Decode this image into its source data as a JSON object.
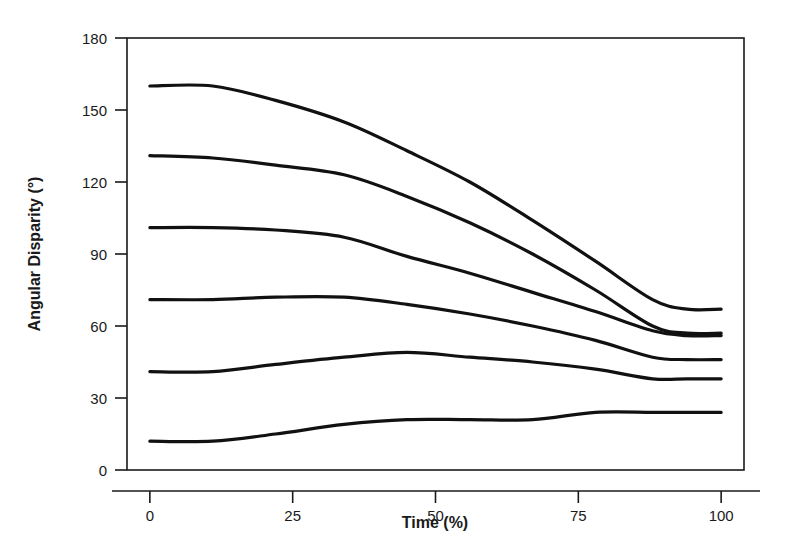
{
  "figure": {
    "background_color": "#ffffff",
    "line_color": "#111111",
    "axis_color": "#1a1a1a"
  },
  "chart_data": {
    "type": "line",
    "title": "",
    "xlabel": "Time (%)",
    "ylabel": "Angular Disparity (°)",
    "xlim": [
      -4,
      104
    ],
    "ylim": [
      0,
      180
    ],
    "xticks": [
      0,
      25,
      50,
      75,
      100
    ],
    "xtick_labels": [
      "0",
      "25",
      "50",
      "75",
      "100"
    ],
    "yticks": [
      0,
      30,
      60,
      90,
      120,
      150,
      180
    ],
    "ytick_labels": [
      "0",
      "30",
      "60",
      "90",
      "120",
      "150",
      "180"
    ],
    "grid": false,
    "legend": null,
    "legend_position": "none",
    "x": [
      0,
      11,
      22,
      34,
      45,
      56,
      67,
      78,
      88,
      94,
      100
    ],
    "series": [
      {
        "name": "curve-1",
        "values": [
          160,
          160,
          154,
          145,
          133,
          120,
          104,
          87,
          71,
          67,
          67
        ]
      },
      {
        "name": "curve-2",
        "values": [
          131,
          130,
          127,
          123,
          114,
          103,
          90,
          75,
          60,
          57,
          57
        ]
      },
      {
        "name": "curve-3",
        "values": [
          101,
          101,
          100,
          97,
          89,
          82,
          74,
          66,
          58,
          56,
          56
        ]
      },
      {
        "name": "curve-4",
        "values": [
          71,
          71,
          72,
          72,
          69,
          65,
          60,
          54,
          47,
          46,
          46
        ]
      },
      {
        "name": "curve-5",
        "values": [
          41,
          41,
          44,
          47,
          49,
          47,
          45,
          42,
          38,
          38,
          38
        ]
      },
      {
        "name": "curve-6",
        "values": [
          12,
          12,
          15,
          19,
          21,
          21,
          21,
          24,
          24,
          24,
          24
        ]
      }
    ]
  }
}
